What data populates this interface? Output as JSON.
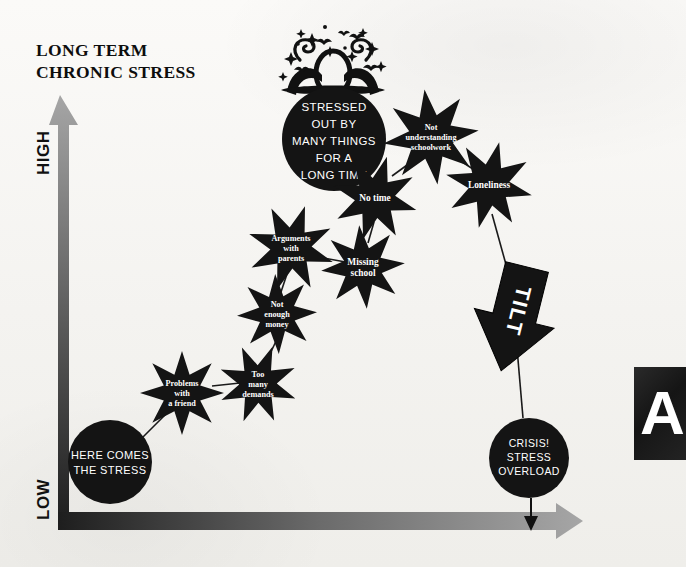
{
  "title": "LONG TERM\nCHRONIC STRESS",
  "axis": {
    "y_top_label": "HIGH",
    "y_bottom_label": "LOW",
    "y_axis_name": "vertical-stress-axis",
    "x_axis_name": "horizontal-time-axis"
  },
  "start_node": {
    "lines": [
      "HERE COMES",
      "THE STRESS"
    ],
    "shape": "circle"
  },
  "headline_node": {
    "lines": [
      "STRESSED",
      "OUT BY",
      "MANY THINGS",
      "FOR A",
      "LONG TIME"
    ],
    "shape": "circle"
  },
  "end_node": {
    "lines": [
      "CRISIS!",
      "STRESS",
      "OVERLOAD"
    ],
    "shape": "circle"
  },
  "tilt": {
    "label": "TILT",
    "shape": "down-arrow"
  },
  "stressors": [
    {
      "id": "problems-with-a-friend",
      "lines": [
        "Problems",
        "with",
        "a friend"
      ],
      "cx": 182,
      "cy": 393,
      "r": 42
    },
    {
      "id": "too-many-demands",
      "lines": [
        "Too",
        "many",
        "demands"
      ],
      "cx": 258,
      "cy": 384,
      "r": 40
    },
    {
      "id": "not-enough-money",
      "lines": [
        "Not",
        "enough",
        "money"
      ],
      "cx": 277,
      "cy": 314,
      "r": 40
    },
    {
      "id": "arguments-with-parents",
      "lines": [
        "Arguments",
        "with",
        "parents"
      ],
      "cx": 291,
      "cy": 248,
      "r": 44
    },
    {
      "id": "missing-school",
      "lines": [
        "Missing",
        "school"
      ],
      "cx": 363,
      "cy": 267,
      "r": 42
    },
    {
      "id": "no-time",
      "lines": [
        "No time"
      ],
      "cx": 375,
      "cy": 198,
      "r": 43
    },
    {
      "id": "not-understanding-schoolwork",
      "lines": [
        "Not",
        "understanding",
        "schoolwork"
      ],
      "cx": 431,
      "cy": 137,
      "r": 48
    },
    {
      "id": "loneliness",
      "lines": [
        "Loneliness"
      ],
      "cx": 489,
      "cy": 185,
      "r": 44
    }
  ],
  "side_panel": {
    "letter": "A"
  },
  "colors": {
    "ink": "#111111",
    "paper": "#f7f6f4",
    "axis_dark": "#262626",
    "axis_light": "#9a9a9a",
    "node_fill": "#141414",
    "node_text": "#ffffff"
  }
}
